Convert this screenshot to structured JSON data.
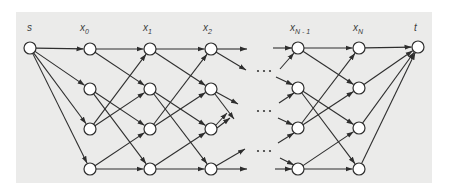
{
  "diagram": {
    "type": "layered shortest-path graph",
    "colors": {
      "background": "#ffffff",
      "panel": "#ebebea",
      "stroke": "#2e2e2e",
      "node_fill": "#ffffff",
      "label": "#3c3c3c"
    },
    "node_radius": 6,
    "labels": [
      {
        "id": "s",
        "base": "s",
        "sub": "",
        "x": 27,
        "y": 31
      },
      {
        "id": "x0",
        "base": "x",
        "sub": "0",
        "x": 80,
        "y": 31
      },
      {
        "id": "x1",
        "base": "x",
        "sub": "1",
        "x": 143,
        "y": 31
      },
      {
        "id": "x2",
        "base": "x",
        "sub": "2",
        "x": 203,
        "y": 31
      },
      {
        "id": "xNm1",
        "base": "x",
        "sub": "N - 1",
        "x": 290,
        "y": 31
      },
      {
        "id": "xN",
        "base": "x",
        "sub": "N",
        "x": 353,
        "y": 31
      },
      {
        "id": "t",
        "base": "t",
        "sub": "",
        "x": 414,
        "y": 31
      }
    ],
    "nodes": [
      {
        "id": "s",
        "x": 30,
        "y": 48
      },
      {
        "id": "x0_0",
        "x": 90,
        "y": 49
      },
      {
        "id": "x0_1",
        "x": 90,
        "y": 89
      },
      {
        "id": "x0_2",
        "x": 90,
        "y": 129
      },
      {
        "id": "x0_3",
        "x": 90,
        "y": 169
      },
      {
        "id": "x1_0",
        "x": 150,
        "y": 49
      },
      {
        "id": "x1_1",
        "x": 150,
        "y": 89
      },
      {
        "id": "x1_2",
        "x": 150,
        "y": 129
      },
      {
        "id": "x1_3",
        "x": 150,
        "y": 169
      },
      {
        "id": "x2_0",
        "x": 211,
        "y": 49
      },
      {
        "id": "x2_1",
        "x": 211,
        "y": 89
      },
      {
        "id": "x2_2",
        "x": 211,
        "y": 129
      },
      {
        "id": "x2_3",
        "x": 211,
        "y": 169
      },
      {
        "id": "xNm1_0",
        "x": 298,
        "y": 48
      },
      {
        "id": "xNm1_1",
        "x": 298,
        "y": 88
      },
      {
        "id": "xNm1_2",
        "x": 298,
        "y": 128
      },
      {
        "id": "xNm1_3",
        "x": 298,
        "y": 169
      },
      {
        "id": "xN_0",
        "x": 359,
        "y": 48
      },
      {
        "id": "xN_1",
        "x": 359,
        "y": 88
      },
      {
        "id": "xN_2",
        "x": 359,
        "y": 128
      },
      {
        "id": "xN_3",
        "x": 359,
        "y": 169
      },
      {
        "id": "t",
        "x": 418,
        "y": 47
      }
    ],
    "edges": [
      [
        "s",
        "x0_0"
      ],
      [
        "s",
        "x0_1"
      ],
      [
        "s",
        "x0_2"
      ],
      [
        "s",
        "x0_3"
      ],
      [
        "x0_0",
        "x1_0"
      ],
      [
        "x0_0",
        "x1_1"
      ],
      [
        "x0_1",
        "x1_2"
      ],
      [
        "x0_1",
        "x1_3"
      ],
      [
        "x0_2",
        "x1_0"
      ],
      [
        "x0_2",
        "x1_1"
      ],
      [
        "x0_3",
        "x1_2"
      ],
      [
        "x0_3",
        "x1_3"
      ],
      [
        "x1_0",
        "x2_0"
      ],
      [
        "x1_0",
        "x2_1"
      ],
      [
        "x1_1",
        "x2_2"
      ],
      [
        "x1_1",
        "x2_3"
      ],
      [
        "x1_2",
        "x2_0"
      ],
      [
        "x1_2",
        "x2_1"
      ],
      [
        "x1_3",
        "x2_2"
      ],
      [
        "x1_3",
        "x2_3"
      ],
      [
        "xNm1_0",
        "xN_0"
      ],
      [
        "xNm1_0",
        "xN_1"
      ],
      [
        "xNm1_1",
        "xN_2"
      ],
      [
        "xNm1_1",
        "xN_3"
      ],
      [
        "xNm1_2",
        "xN_0"
      ],
      [
        "xNm1_2",
        "xN_1"
      ],
      [
        "xNm1_3",
        "xN_2"
      ],
      [
        "xNm1_3",
        "xN_3"
      ],
      [
        "xN_0",
        "t"
      ],
      [
        "xN_1",
        "t"
      ],
      [
        "xN_2",
        "t"
      ],
      [
        "xN_3",
        "t"
      ]
    ],
    "stub_arrows": [
      {
        "x1": 217,
        "y1": 49,
        "x2": 247,
        "y2": 49
      },
      {
        "x1": 216,
        "y1": 52,
        "x2": 246,
        "y2": 70
      },
      {
        "x1": 216,
        "y1": 92,
        "x2": 238,
        "y2": 104
      },
      {
        "x1": 215,
        "y1": 94,
        "x2": 234,
        "y2": 119
      },
      {
        "x1": 216,
        "y1": 125,
        "x2": 227,
        "y2": 113
      },
      {
        "x1": 217,
        "y1": 128,
        "x2": 230,
        "y2": 118
      },
      {
        "x1": 216,
        "y1": 166,
        "x2": 245,
        "y2": 149
      },
      {
        "x1": 217,
        "y1": 169,
        "x2": 247,
        "y2": 169
      },
      {
        "x1": 273,
        "y1": 48,
        "x2": 292,
        "y2": 48
      },
      {
        "x1": 280,
        "y1": 69,
        "x2": 294,
        "y2": 53
      },
      {
        "x1": 276,
        "y1": 77,
        "x2": 293,
        "y2": 85
      },
      {
        "x1": 279,
        "y1": 103,
        "x2": 294,
        "y2": 93
      },
      {
        "x1": 278,
        "y1": 118,
        "x2": 293,
        "y2": 125
      },
      {
        "x1": 278,
        "y1": 143,
        "x2": 294,
        "y2": 133
      },
      {
        "x1": 280,
        "y1": 158,
        "x2": 294,
        "y2": 165
      },
      {
        "x1": 275,
        "y1": 169,
        "x2": 292,
        "y2": 169
      }
    ],
    "ellipsis_rows": [
      {
        "y": 71,
        "xs": [
          258,
          264,
          270
        ]
      },
      {
        "y": 111,
        "xs": [
          258,
          264,
          270
        ]
      },
      {
        "y": 151,
        "xs": [
          258,
          264,
          270
        ]
      }
    ]
  }
}
